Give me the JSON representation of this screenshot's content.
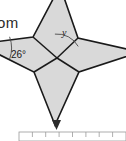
{
  "page": {
    "width": 126,
    "height": 141,
    "background": "#ffffff"
  },
  "clipped_text": {
    "value": "om"
  },
  "diagram": {
    "name": "four-pointed-star-angle-diagram",
    "shape": "four-pointed concave star (8-gon)",
    "fill_color": "#d9d9d9",
    "stroke_color": "#1a1a1a",
    "center": {
      "x": 57,
      "y": 58
    },
    "outer_points": [
      {
        "name": "top-point",
        "x": 60,
        "y": -14
      },
      {
        "name": "right-point",
        "x": 140,
        "y": 52
      },
      {
        "name": "bottom-point",
        "x": 55,
        "y": 125
      },
      {
        "name": "left-point",
        "x": -22,
        "y": 44
      }
    ],
    "inner_points": [
      {
        "name": "inner-upper-right",
        "x": 78,
        "y": 38
      },
      {
        "name": "inner-lower-right",
        "x": 79,
        "y": 72
      },
      {
        "name": "inner-lower-left",
        "x": 34,
        "y": 72
      },
      {
        "name": "inner-upper-left",
        "x": 33,
        "y": 37
      }
    ],
    "labels": [
      {
        "id": "angle-26",
        "text": "26°",
        "x": 18,
        "y": 54,
        "style": "upright",
        "arc": {
          "cx": 2,
          "cy": 48,
          "r": 33,
          "start_deg": -14,
          "end_deg": 14
        }
      },
      {
        "id": "angle-y",
        "text": "y",
        "x": 64,
        "y": 36,
        "style": "italic",
        "arc": {
          "cx": 57,
          "cy": 58,
          "r": 24,
          "start_deg": -95,
          "end_deg": -28
        }
      }
    ]
  },
  "ruler": {
    "name": "measurement-scale",
    "x": 19,
    "y": 132,
    "width": 107,
    "height": 9,
    "tick_count": 8,
    "marker": {
      "x": 56,
      "y": 121,
      "shape": "down-caret"
    },
    "border_color": "#9a9a9a"
  }
}
